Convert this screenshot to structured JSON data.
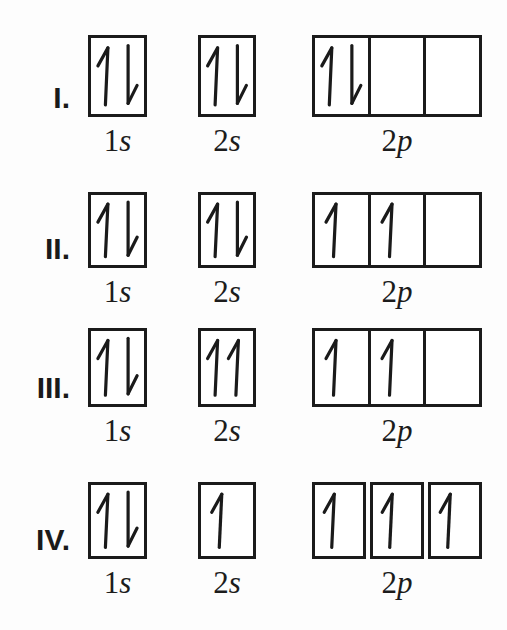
{
  "colors": {
    "ink": "#1a1a1a",
    "box_border": "#1b1b1b",
    "background": "#fdfdfd"
  },
  "rows": [
    {
      "numeral": "I.",
      "orbitals": [
        {
          "name": "1s",
          "label_number": "1",
          "label_letter": "s",
          "split_boxes": false,
          "cells": [
            [
              "up",
              "down"
            ]
          ]
        },
        {
          "name": "2s",
          "label_number": "2",
          "label_letter": "s",
          "split_boxes": false,
          "cells": [
            [
              "up",
              "down"
            ]
          ]
        },
        {
          "name": "2p",
          "label_number": "2",
          "label_letter": "p",
          "split_boxes": false,
          "cells": [
            [
              "up",
              "down"
            ],
            [],
            []
          ]
        }
      ]
    },
    {
      "numeral": "II.",
      "orbitals": [
        {
          "name": "1s",
          "label_number": "1",
          "label_letter": "s",
          "split_boxes": false,
          "cells": [
            [
              "up",
              "down"
            ]
          ]
        },
        {
          "name": "2s",
          "label_number": "2",
          "label_letter": "s",
          "split_boxes": false,
          "cells": [
            [
              "up",
              "down"
            ]
          ]
        },
        {
          "name": "2p",
          "label_number": "2",
          "label_letter": "p",
          "split_boxes": false,
          "cells": [
            [
              "up"
            ],
            [
              "up"
            ],
            []
          ]
        }
      ]
    },
    {
      "numeral": "III.",
      "orbitals": [
        {
          "name": "1s",
          "label_number": "1",
          "label_letter": "s",
          "split_boxes": false,
          "cells": [
            [
              "up",
              "down"
            ]
          ]
        },
        {
          "name": "2s",
          "label_number": "2",
          "label_letter": "s",
          "split_boxes": false,
          "cells": [
            [
              "up",
              "up"
            ]
          ]
        },
        {
          "name": "2p",
          "label_number": "2",
          "label_letter": "p",
          "split_boxes": false,
          "cells": [
            [
              "up"
            ],
            [
              "up"
            ],
            []
          ]
        }
      ]
    },
    {
      "numeral": "IV.",
      "orbitals": [
        {
          "name": "1s",
          "label_number": "1",
          "label_letter": "s",
          "split_boxes": false,
          "cells": [
            [
              "up",
              "down"
            ]
          ]
        },
        {
          "name": "2s",
          "label_number": "2",
          "label_letter": "s",
          "split_boxes": false,
          "cells": [
            [
              "up"
            ]
          ]
        },
        {
          "name": "2p",
          "label_number": "2",
          "label_letter": "p",
          "split_boxes": true,
          "cells": [
            [
              "up"
            ],
            [
              "up"
            ],
            [
              "up"
            ]
          ]
        }
      ]
    }
  ]
}
